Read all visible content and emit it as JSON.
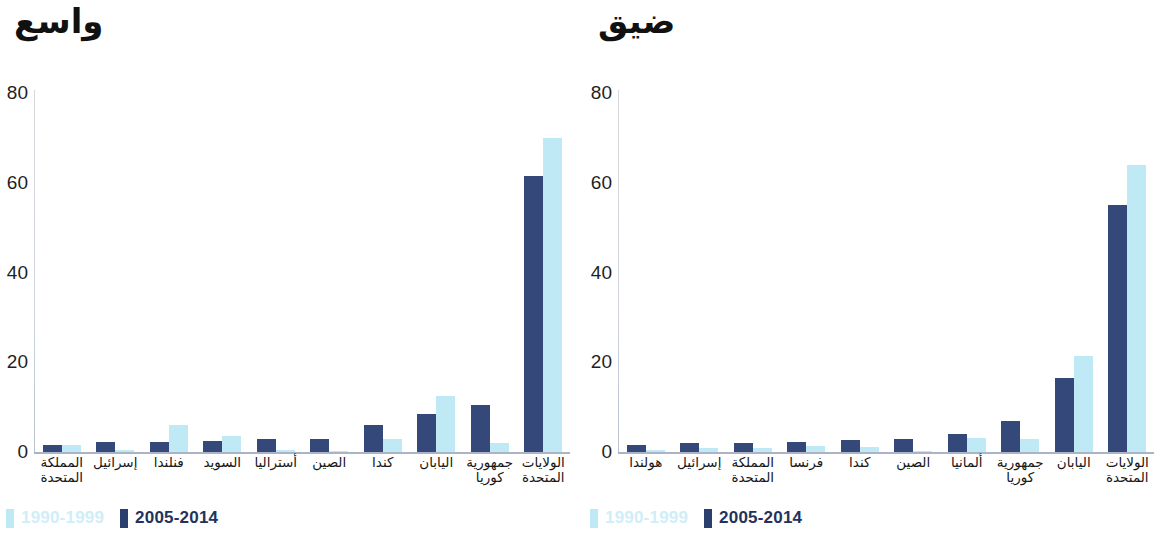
{
  "charts": [
    {
      "id": "broad",
      "title": "واسع",
      "legend": [
        {
          "label": "1990-1999",
          "color": "#bfeaf5"
        },
        {
          "label": "2005-2014",
          "color": "#2b3f6e"
        }
      ],
      "chart_data": {
        "type": "bar",
        "title": "واسع",
        "xlabel": "",
        "ylabel": "",
        "ylim": [
          0,
          80
        ],
        "yticks": [
          0,
          20,
          40,
          60,
          80
        ],
        "grid": false,
        "legend_position": "bottom-left",
        "direction": "rtl",
        "categories": [
          "الولايات المتحدة",
          "جمهورية كوريا",
          "اليابان",
          "كندا",
          "الصين",
          "أستراليا",
          "السويد",
          "فنلندا",
          "إسرائيل",
          "المملكة المتحدة"
        ],
        "series": [
          {
            "name": "1990-1999",
            "color": "#bfeaf5",
            "values": [
              70,
              2,
              12.5,
              3,
              0.3,
              0.5,
              3.5,
              6,
              0.5,
              1.5
            ]
          },
          {
            "name": "2005-2014",
            "color": "#34497a",
            "values": [
              61.5,
              10.5,
              8.5,
              6,
              3,
              2.8,
              2.5,
              2.3,
              2.2,
              1.5
            ]
          }
        ]
      }
    },
    {
      "id": "narrow",
      "title": "ضيق",
      "legend": [
        {
          "label": "1990-1999",
          "color": "#bfeaf5"
        },
        {
          "label": "2005-2014",
          "color": "#2b3f6e"
        }
      ],
      "chart_data": {
        "type": "bar",
        "title": "ضيق",
        "xlabel": "",
        "ylabel": "",
        "ylim": [
          0,
          80
        ],
        "yticks": [
          0,
          20,
          40,
          60,
          80
        ],
        "grid": false,
        "legend_position": "bottom-left",
        "direction": "rtl",
        "categories": [
          "الولايات المتحدة",
          "اليابان",
          "جمهورية كوريا",
          "ألمانيا",
          "الصين",
          "كندا",
          "فرنسا",
          "المملكة المتحدة",
          "إسرائيل",
          "هولندا"
        ],
        "series": [
          {
            "name": "1990-1999",
            "color": "#bfeaf5",
            "values": [
              64,
              21.5,
              2.8,
              3.2,
              0.3,
              1.2,
              1.3,
              1.0,
              0.8,
              0.4
            ]
          },
          {
            "name": "2005-2014",
            "color": "#34497a",
            "values": [
              55,
              16.5,
              7,
              4,
              3,
              2.6,
              2.2,
              2.1,
              2.0,
              1.5
            ]
          }
        ]
      }
    }
  ]
}
